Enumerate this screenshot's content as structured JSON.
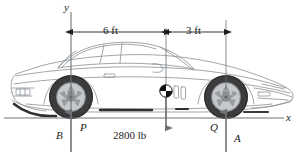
{
  "figure": {
    "type": "free-body-diagram",
    "axes": {
      "y_label": "y",
      "x_label": "x"
    },
    "dimensions": [
      {
        "label": "6 ft",
        "from": "rear-wheel-axis",
        "to": "center-of-gravity-axis"
      },
      {
        "label": "3 ft",
        "from": "center-of-gravity-axis",
        "to": "front-wheel-axis"
      }
    ],
    "forces": [
      {
        "name": "P",
        "label": "P",
        "point": "B",
        "point_label": "B",
        "direction": "up"
      },
      {
        "name": "W",
        "label": "2800 lb",
        "point": "G",
        "direction": "down"
      },
      {
        "name": "A",
        "label": "A",
        "point": "Q",
        "point_label": "Q",
        "direction": "up"
      }
    ],
    "colors": {
      "line": "#231f20",
      "body_outline": "#8a8f94",
      "tire": "#3a3a3a",
      "rim": "#b9bcc0",
      "ground": "#6f7276",
      "arrow": "#6f7276",
      "cg_dark": "#111111",
      "cg_light": "#ffffff"
    }
  }
}
